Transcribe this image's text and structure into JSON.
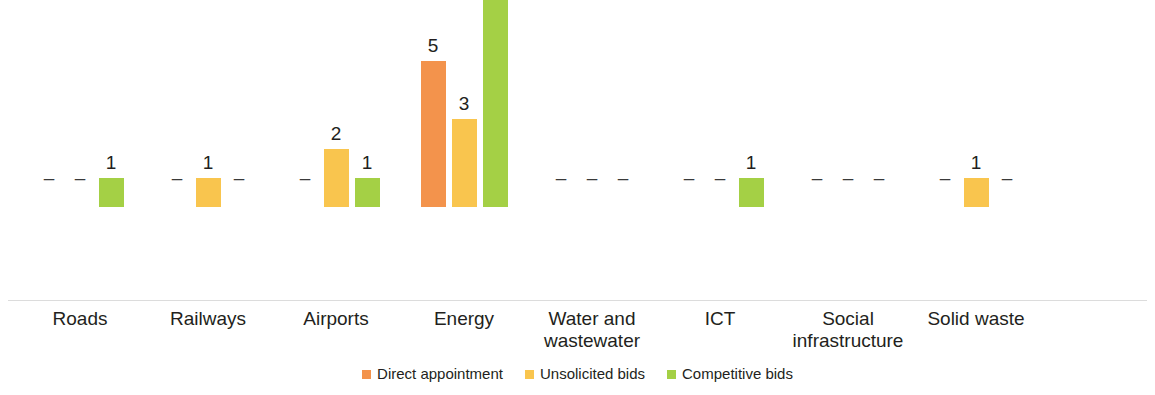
{
  "chart_data": {
    "type": "bar",
    "title": "",
    "subtitle": "",
    "xlabel": "",
    "ylabel": "",
    "grid": false,
    "legend_position": "bottom",
    "ylim": [
      0,
      10
    ],
    "missing_marker": "–",
    "categories": [
      "Roads",
      "Railways",
      "Airports",
      "Energy",
      "Water and wastewater",
      "ICT",
      "Social infrastructure",
      "Solid waste"
    ],
    "series": [
      {
        "name": "Direct appointment",
        "color": "#F3934C",
        "values": [
          null,
          null,
          null,
          5,
          null,
          null,
          null,
          null
        ],
        "labels": [
          "–",
          "–",
          "–",
          "5",
          "–",
          "–",
          "–",
          "–"
        ]
      },
      {
        "name": "Unsolicited bids",
        "color": "#F9C54E",
        "values": [
          null,
          1,
          2,
          3,
          null,
          null,
          null,
          1
        ],
        "labels": [
          "–",
          "1",
          "2",
          "3",
          "–",
          "–",
          "–",
          "1"
        ]
      },
      {
        "name": "Competitive bids",
        "color": "#A4D045",
        "values": [
          1,
          null,
          1,
          9,
          null,
          1,
          null,
          null
        ],
        "labels": [
          "1",
          "–",
          "1",
          "9",
          "–",
          "1",
          "–",
          "–"
        ]
      }
    ]
  },
  "legend": {
    "items": [
      {
        "label": "Direct appointment",
        "color": "#F3934C"
      },
      {
        "label": "Unsolicited bids",
        "color": "#F9C54E"
      },
      {
        "label": "Competitive bids",
        "color": "#A4D045"
      }
    ]
  },
  "axis": {
    "baseline_color": "#dcdcdc"
  }
}
